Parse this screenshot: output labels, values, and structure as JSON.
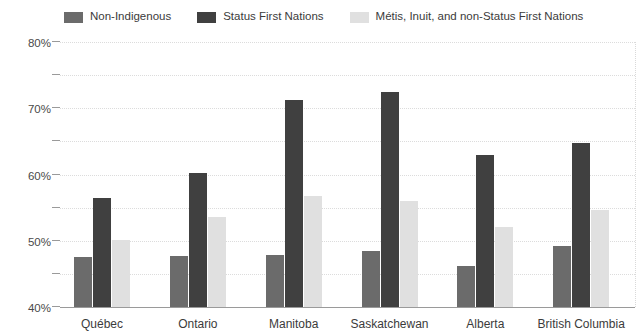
{
  "chart_data": {
    "type": "bar",
    "title": "",
    "subtitle": "",
    "xlabel": "",
    "ylabel": "",
    "ylim": [
      0,
      80
    ],
    "ytick_labels": [
      "0%",
      "10%",
      "20%",
      "30%",
      "40%",
      "50%",
      "60%",
      "70%",
      "80%"
    ],
    "ytick_values": [
      0,
      10,
      20,
      30,
      40,
      50,
      60,
      70,
      80
    ],
    "grid": true,
    "legend_position": "top",
    "categories": [
      "Québec",
      "Ontario",
      "Manitoba",
      "Saskatchewan",
      "Alberta",
      "British Columbia"
    ],
    "series": [
      {
        "name": "Non-Indigenous",
        "color": "#6b6b6b",
        "values": [
          15.0,
          15.5,
          15.8,
          17.0,
          12.3,
          18.3
        ]
      },
      {
        "name": "Status First Nations",
        "color": "#404040",
        "values": [
          33.0,
          40.5,
          62.5,
          65.0,
          46.0,
          49.5
        ]
      },
      {
        "name": "Métis, Inuit, and non-Status First Nations",
        "color": "#e0e0e0",
        "values": [
          20.3,
          27.3,
          33.5,
          32.0,
          24.2,
          29.2
        ]
      }
    ]
  },
  "axis": {
    "zero_line_color": "#9a9a9a",
    "gridline_color": "#dcdcdc"
  }
}
